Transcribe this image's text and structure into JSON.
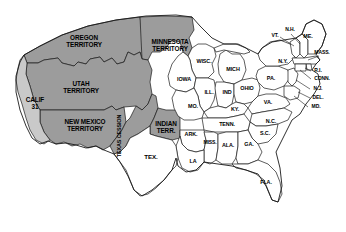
{
  "map": {
    "title": "United States 1850 Territorial Map",
    "colors": {
      "territory_fill": "#9c9c9c",
      "california_fill": "#c9c9c9",
      "state_fill": "#ffffff",
      "border": "#1a1a1a",
      "background": "#ffffff",
      "label_text": "#000000"
    },
    "territories": [
      {
        "id": "oregon-territory",
        "label": "OREGON\nTERRITORY",
        "x": 84,
        "y": 42,
        "shade": "dark"
      },
      {
        "id": "utah-territory",
        "label": "UTAH\nTERRITORY",
        "x": 81,
        "y": 88,
        "shade": "dark"
      },
      {
        "id": "new-mexico-territory",
        "label": "NEW MEXICO\nTERRITORY",
        "x": 85,
        "y": 126,
        "shade": "dark"
      },
      {
        "id": "minnesota-territory",
        "label": "MINNESOTA\nTERRITORY",
        "x": 170,
        "y": 46,
        "shade": "dark"
      },
      {
        "id": "indian-territory",
        "label": "INDIAN\nTERR.",
        "x": 166,
        "y": 128,
        "shade": "dark"
      },
      {
        "id": "texas-cession",
        "label": "TEXAS CESSION",
        "x": 120,
        "y": 136,
        "shade": "dark",
        "orientation": "vertical"
      },
      {
        "id": "california",
        "label": "CALIF\n31",
        "x": 35,
        "y": 104,
        "shade": "light"
      }
    ],
    "states": [
      {
        "id": "wisconsin",
        "label": "WISC.",
        "x": 204,
        "y": 62
      },
      {
        "id": "michigan",
        "label": "MICH",
        "x": 233,
        "y": 70
      },
      {
        "id": "iowa",
        "label": "IOWA",
        "x": 184,
        "y": 80
      },
      {
        "id": "illinois",
        "label": "ILL.",
        "x": 209,
        "y": 93
      },
      {
        "id": "indiana",
        "label": "IND",
        "x": 227,
        "y": 93
      },
      {
        "id": "ohio",
        "label": "OHIO",
        "x": 247,
        "y": 89
      },
      {
        "id": "missouri",
        "label": "MO.",
        "x": 193,
        "y": 107
      },
      {
        "id": "kentucky",
        "label": "KY.",
        "x": 235,
        "y": 110
      },
      {
        "id": "pennsylvania",
        "label": "PA.",
        "x": 271,
        "y": 79
      },
      {
        "id": "virginia",
        "label": "VA.",
        "x": 268,
        "y": 103
      },
      {
        "id": "tennessee",
        "label": "TENN.",
        "x": 227,
        "y": 125
      },
      {
        "id": "arkansas",
        "label": "ARK.",
        "x": 191,
        "y": 135
      },
      {
        "id": "north-carolina",
        "label": "N.C.",
        "x": 271,
        "y": 122
      },
      {
        "id": "south-carolina",
        "label": "S.C.",
        "x": 265,
        "y": 134
      },
      {
        "id": "mississippi",
        "label": "MISS.",
        "x": 210,
        "y": 143
      },
      {
        "id": "alabama",
        "label": "ALA.",
        "x": 228,
        "y": 146
      },
      {
        "id": "georgia",
        "label": "GA.",
        "x": 249,
        "y": 145
      },
      {
        "id": "louisiana",
        "label": "LA",
        "x": 193,
        "y": 162
      },
      {
        "id": "florida",
        "label": "FLA.",
        "x": 266,
        "y": 183
      },
      {
        "id": "texas",
        "label": "TEX.",
        "x": 151,
        "y": 157
      },
      {
        "id": "new-york",
        "label": "N.Y.",
        "x": 283,
        "y": 62
      },
      {
        "id": "vermont",
        "label": "VT.",
        "x": 275,
        "y": 36
      },
      {
        "id": "new-hampshire",
        "label": "N.H.",
        "x": 290,
        "y": 30
      },
      {
        "id": "maine",
        "label": "ME.",
        "x": 308,
        "y": 37
      },
      {
        "id": "massachusetts",
        "label": "MASS.",
        "x": 322,
        "y": 53
      },
      {
        "id": "rhode-island",
        "label": "R.I.",
        "x": 318,
        "y": 71
      },
      {
        "id": "connecticut",
        "label": "CONN.",
        "x": 322,
        "y": 79
      },
      {
        "id": "new-jersey",
        "label": "N.J.",
        "x": 318,
        "y": 89
      },
      {
        "id": "delaware",
        "label": "DEL.",
        "x": 318,
        "y": 98
      },
      {
        "id": "maryland",
        "label": "MD.",
        "x": 316,
        "y": 107
      }
    ]
  }
}
